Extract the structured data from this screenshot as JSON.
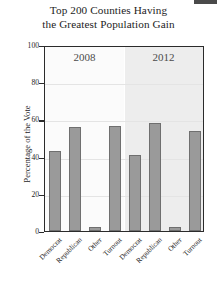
{
  "chart_data": {
    "type": "bar",
    "title": "Top 200 Counties Having the Greatest Population Gain",
    "title_line1": "Top 200 Counties Having",
    "title_line2": "the Greatest Population Gain",
    "xlabel": "",
    "ylabel": "Percentage of the Vote",
    "ylim": [
      0,
      100
    ],
    "yticks": [
      0,
      20,
      40,
      60,
      80,
      100
    ],
    "ytick_labels": [
      "0",
      "20",
      "40",
      "60",
      "80",
      "100"
    ],
    "grid": true,
    "legend": "none",
    "panels": [
      "2008",
      "2012"
    ],
    "categories": [
      "Democrat",
      "Republican",
      "Other",
      "Turnout"
    ],
    "series": [
      {
        "name": "2008",
        "values": [
          43,
          56,
          2,
          56.5
        ]
      },
      {
        "name": "2012",
        "values": [
          41,
          58,
          2,
          54
        ]
      }
    ],
    "colors": {
      "bar_fill": "#9a9a9a",
      "bar_edge": "#6f6f6f",
      "panel_left_bg": "#fbfbfb",
      "panel_right_bg": "#ededed",
      "gridline": "#e4e4e4",
      "frame": "#2b2b2b",
      "text": "#1d1d1d"
    }
  }
}
